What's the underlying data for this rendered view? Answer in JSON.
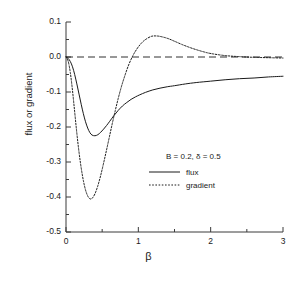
{
  "chart_data": {
    "type": "line",
    "title": "",
    "xlabel": "β",
    "ylabel": "flux or gradient",
    "xlim": [
      0,
      3
    ],
    "ylim": [
      -0.5,
      0.1
    ],
    "xticks": [
      "0",
      "1",
      "2",
      "3"
    ],
    "xtick_values": [
      0,
      1,
      2,
      3
    ],
    "yticks": [
      "0.1",
      "0.0",
      "-0.1",
      "-0.2",
      "-0.3",
      "-0.4",
      "-0.5"
    ],
    "ytick_values": [
      0.1,
      0.0,
      -0.1,
      -0.2,
      -0.3,
      -0.4,
      -0.5
    ],
    "x_minor_ticks": [
      0.5,
      1.5,
      2.5
    ],
    "y_minor_ticks": [
      0.05,
      -0.05,
      -0.15,
      -0.25,
      -0.35,
      -0.45
    ],
    "grid": false,
    "legend_position": "center-right",
    "annotation": "B = 0.2, δ = 0.5",
    "zero_line": {
      "value": 0.0,
      "style": "dashed"
    },
    "series": [
      {
        "name": "flux",
        "style": "solid",
        "color": "#1a1a1a",
        "x": [
          0.0,
          0.03,
          0.06,
          0.09,
          0.12,
          0.15,
          0.18,
          0.21,
          0.24,
          0.27,
          0.3,
          0.33,
          0.36,
          0.4,
          0.44,
          0.48,
          0.52,
          0.56,
          0.6,
          0.66,
          0.72,
          0.78,
          0.84,
          0.9,
          0.96,
          1.02,
          1.1,
          1.2,
          1.3,
          1.4,
          1.5,
          1.65,
          1.8,
          2.0,
          2.2,
          2.4,
          2.6,
          2.8,
          3.0
        ],
        "y": [
          0.0,
          -0.004,
          -0.013,
          -0.028,
          -0.05,
          -0.077,
          -0.106,
          -0.135,
          -0.162,
          -0.185,
          -0.203,
          -0.216,
          -0.223,
          -0.225,
          -0.222,
          -0.215,
          -0.206,
          -0.196,
          -0.185,
          -0.168,
          -0.153,
          -0.14,
          -0.13,
          -0.121,
          -0.114,
          -0.108,
          -0.101,
          -0.094,
          -0.089,
          -0.085,
          -0.082,
          -0.077,
          -0.073,
          -0.069,
          -0.065,
          -0.062,
          -0.06,
          -0.057,
          -0.055
        ]
      },
      {
        "name": "gradient",
        "style": "dotted",
        "color": "#1a1a1a",
        "x": [
          0.0,
          0.03,
          0.06,
          0.09,
          0.12,
          0.15,
          0.18,
          0.21,
          0.24,
          0.27,
          0.3,
          0.33,
          0.36,
          0.4,
          0.44,
          0.48,
          0.52,
          0.56,
          0.6,
          0.64,
          0.68,
          0.72,
          0.76,
          0.8,
          0.86,
          0.92,
          0.98,
          1.04,
          1.1,
          1.18,
          1.26,
          1.34,
          1.42,
          1.5,
          1.6,
          1.7,
          1.8,
          1.9,
          2.0,
          2.2,
          2.4,
          2.6,
          2.8,
          3.0
        ],
        "y": [
          0.0,
          -0.012,
          -0.045,
          -0.096,
          -0.157,
          -0.218,
          -0.272,
          -0.317,
          -0.353,
          -0.38,
          -0.397,
          -0.405,
          -0.404,
          -0.391,
          -0.368,
          -0.338,
          -0.303,
          -0.266,
          -0.228,
          -0.19,
          -0.154,
          -0.12,
          -0.089,
          -0.062,
          -0.026,
          0.002,
          0.023,
          0.039,
          0.05,
          0.059,
          0.06,
          0.057,
          0.052,
          0.045,
          0.036,
          0.028,
          0.021,
          0.015,
          0.01,
          0.004,
          0.001,
          -0.001,
          -0.002,
          -0.003
        ]
      }
    ]
  },
  "legend": {
    "annotation": "B = 0.2, δ = 0.5",
    "entries": [
      {
        "label": "flux",
        "style": "solid"
      },
      {
        "label": "gradient",
        "style": "dotted"
      }
    ]
  },
  "axes": {
    "xlabel": "β",
    "ylabel": "flux or gradient"
  }
}
